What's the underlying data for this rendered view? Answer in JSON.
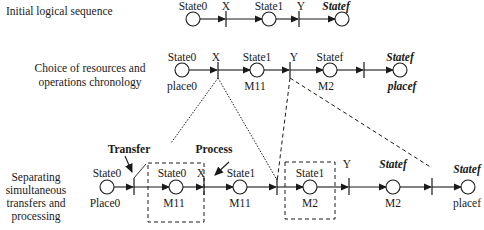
{
  "rows": [
    {
      "label_lines": [
        "Initial logical sequence"
      ],
      "nodes": [
        {
          "state": "State0",
          "place": ""
        },
        {
          "transition": "X"
        },
        {
          "state": "State1",
          "place": ""
        },
        {
          "transition": "Y"
        },
        {
          "state": "Statef",
          "place": ""
        }
      ]
    },
    {
      "label_lines": [
        "Choice of resources and",
        "operations chronology"
      ],
      "nodes": [
        {
          "state": "State0",
          "place": "place0"
        },
        {
          "transition": "X"
        },
        {
          "state": "State1",
          "place": "M11"
        },
        {
          "transition": "Y"
        },
        {
          "state": "Statef",
          "place": "M2"
        },
        {
          "transition": ""
        },
        {
          "state": "Statef",
          "place": "placef"
        }
      ]
    },
    {
      "label_lines": [
        "Separating",
        "simultaneous",
        "transfers and",
        "processing"
      ],
      "nodes": [
        {
          "state": "State0",
          "place": "Place0"
        },
        {
          "transition": ""
        },
        {
          "state": "State0",
          "place": "M11"
        },
        {
          "transition": "X"
        },
        {
          "state": "State1",
          "place": "M11"
        },
        {
          "transition": ""
        },
        {
          "state": "State1",
          "place": "M2"
        },
        {
          "transition": "Y"
        },
        {
          "state": "Statef",
          "place": "M2"
        },
        {
          "transition": ""
        },
        {
          "state": "Statef",
          "place": "placef"
        }
      ],
      "annotations": {
        "transfer": "Transfer",
        "process": "Process"
      }
    }
  ],
  "text": {
    "r1_label": "Initial logical sequence",
    "r2_label_1": "Choice of resources and",
    "r2_label_2": "operations chronology",
    "r3_label_1": "Separating",
    "r3_label_2": "simultaneous",
    "r3_label_3": "transfers and",
    "r3_label_4": "processing",
    "state0": "State0",
    "state1": "State1",
    "statef": "Statef",
    "x": "X",
    "y": "Y",
    "place0": "place0",
    "Place0": "Place0",
    "m11": "M11",
    "m2": "M2",
    "placef": "placef",
    "transfer": "Transfer",
    "process": "Process"
  }
}
